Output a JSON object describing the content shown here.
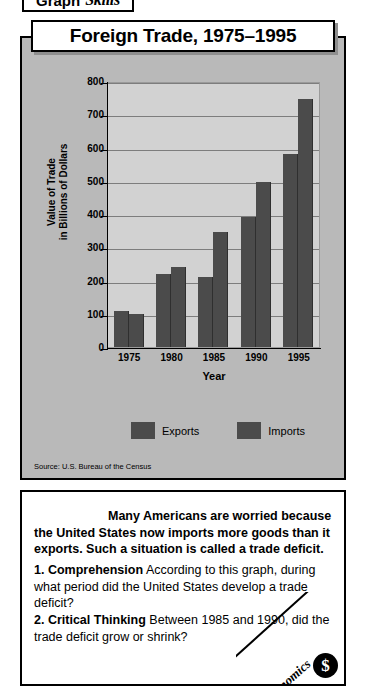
{
  "chart_panel": {
    "title": "Foreign Trade, 1975–1995",
    "source": "Source:  U.S. Bureau of the Census"
  },
  "chart_data": {
    "type": "bar",
    "title": "Foreign Trade, 1975–1995",
    "xlabel": "Year",
    "ylabel": "Value of Trade in Billions of Dollars",
    "ylabel_line1": "Value of Trade",
    "ylabel_line2": "in Billions of Dollars",
    "categories": [
      "1975",
      "1980",
      "1985",
      "1990",
      "1995"
    ],
    "yticks": [
      800,
      700,
      600,
      500,
      400,
      300,
      200,
      100,
      0
    ],
    "ylim": [
      0,
      800
    ],
    "grid": true,
    "legend_position": "bottom",
    "bar_color": "#4b4b4b",
    "plot_bg": "#d2d2d2",
    "panel_bg": "#b9b9b9",
    "series": [
      {
        "name": "Exports",
        "values": [
          108,
          220,
          210,
          390,
          580
        ]
      },
      {
        "name": "Imports",
        "values": [
          100,
          240,
          345,
          495,
          745
        ]
      }
    ]
  },
  "skills": {
    "badge_word1": "Graph",
    "badge_word2": "Skills",
    "intro": "Many Americans are worried because the United States now imports more goods than it exports. Such a situation is called a trade deficit.",
    "questions": [
      {
        "number": "1.",
        "kind": "Comprehension",
        "text": "According to this graph, during what period did the United States develop a trade deficit?"
      },
      {
        "number": "2.",
        "kind": "Critical Thinking",
        "text": "Between 1985 and 1990, did the trade deficit grow or shrink?"
      }
    ]
  },
  "corner_badge": {
    "label": "Economics",
    "icon": "dollar-coin-icon",
    "symbol": "$"
  }
}
